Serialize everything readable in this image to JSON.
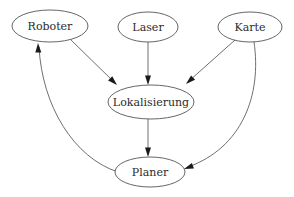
{
  "diagram": {
    "type": "directed-graph",
    "background_color": "#ffffff",
    "node_stroke_color": "#4a4a4a",
    "edge_stroke_color": "#555555",
    "arrow_fill_color": "#1a1a1a",
    "label_color": "#2b2b2b",
    "nodes": [
      {
        "id": "roboter",
        "label": "Roboter",
        "cx": 50,
        "cy": 26,
        "rx": 38,
        "ry": 16,
        "font_size": 11
      },
      {
        "id": "laser",
        "label": "Laser",
        "cx": 148,
        "cy": 27,
        "rx": 30,
        "ry": 15,
        "font_size": 11
      },
      {
        "id": "karte",
        "label": "Karte",
        "cx": 250,
        "cy": 27,
        "rx": 32,
        "ry": 15,
        "font_size": 11
      },
      {
        "id": "lokalisierung",
        "label": "Lokalisierung",
        "cx": 151,
        "cy": 102,
        "rx": 43,
        "ry": 17,
        "font_size": 11
      },
      {
        "id": "planer",
        "label": "Planer",
        "cx": 150,
        "cy": 172,
        "rx": 35,
        "ry": 15,
        "font_size": 11
      }
    ],
    "edges": [
      {
        "id": "roboter-to-lokalisierung",
        "from": "Roboter",
        "to": "Lokalisierung",
        "shape": "straight",
        "path": "M 70,39 L 114,82",
        "arrow_at": [
          117,
          85
        ],
        "arrow_angle": 44
      },
      {
        "id": "laser-to-lokalisierung",
        "from": "Laser",
        "to": "Lokalisierung",
        "shape": "straight",
        "path": "M 148,42 L 148,82",
        "arrow_at": [
          148,
          85
        ],
        "arrow_angle": 90
      },
      {
        "id": "karte-to-lokalisierung",
        "from": "Karte",
        "to": "Lokalisierung",
        "shape": "straight",
        "path": "M 235,40 L 189,81",
        "arrow_at": [
          186,
          84
        ],
        "arrow_angle": 138
      },
      {
        "id": "lokalisierung-to-planer",
        "from": "Lokalisierung",
        "to": "Planer",
        "shape": "straight",
        "path": "M 148,119 L 148,154",
        "arrow_at": [
          148,
          157
        ],
        "arrow_angle": 90
      },
      {
        "id": "karte-to-planer",
        "from": "Karte",
        "to": "Planer",
        "shape": "curved",
        "path": "M 254,42 C 262,95 242,148 188,167",
        "arrow_at": [
          184,
          169
        ],
        "arrow_angle": 160
      },
      {
        "id": "planer-to-roboter",
        "from": "Planer",
        "to": "Roboter",
        "shape": "curved",
        "path": "M 118,172 C 74,158 42,106 39,47",
        "arrow_at": [
          38,
          43
        ],
        "arrow_angle": 268
      }
    ]
  }
}
